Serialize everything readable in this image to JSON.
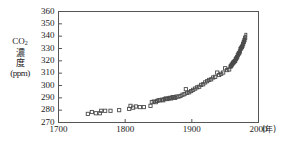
{
  "chart_data": {
    "type": "scatter",
    "title": "",
    "xlabel": "(年)",
    "ylabel": "CO2 濃度 (ppm)",
    "xlim": [
      1700,
      2000
    ],
    "ylim": [
      270,
      360
    ],
    "xticks": [
      1700,
      1800,
      1900,
      2000
    ],
    "yticks": [
      270,
      280,
      290,
      300,
      310,
      320,
      330,
      340,
      350,
      360
    ],
    "grid": false,
    "legend": null,
    "marker": "open-square",
    "series": [
      {
        "name": "CO2 concentration",
        "x": [
          1744,
          1750,
          1756,
          1762,
          1764,
          1770,
          1778,
          1791,
          1806,
          1808,
          1812,
          1816,
          1822,
          1828,
          1838,
          1840,
          1843,
          1846,
          1848,
          1850,
          1852,
          1855,
          1857,
          1859,
          1861,
          1863,
          1865,
          1867,
          1869,
          1871,
          1873,
          1875,
          1877,
          1880,
          1883,
          1886,
          1889,
          1891,
          1893,
          1896,
          1899,
          1902,
          1905,
          1908,
          1911,
          1914,
          1917,
          1920,
          1923,
          1926,
          1929,
          1932,
          1935,
          1938,
          1941,
          1944,
          1947,
          1950,
          1953,
          1956,
          1958,
          1959,
          1960,
          1961,
          1962,
          1963,
          1964,
          1965,
          1966,
          1967,
          1968,
          1969,
          1970,
          1971,
          1972,
          1973,
          1974,
          1975,
          1976,
          1977,
          1978,
          1979,
          1980
        ],
        "y": [
          277.0,
          278.5,
          277.5,
          277.5,
          279.5,
          279.5,
          279.5,
          280.0,
          281.0,
          283.5,
          282.0,
          283.0,
          282.5,
          282.5,
          283.5,
          286.5,
          287.0,
          286.5,
          287.5,
          288.0,
          288.0,
          288.5,
          288.0,
          289.0,
          289.5,
          289.0,
          289.5,
          290.0,
          289.5,
          290.5,
          290.5,
          290.0,
          291.0,
          291.0,
          291.5,
          292.5,
          293.0,
          297.0,
          294.0,
          294.5,
          295.5,
          296.5,
          297.5,
          298.5,
          299.0,
          300.5,
          301.0,
          302.5,
          303.5,
          304.5,
          305.0,
          306.5,
          307.0,
          310.5,
          308.5,
          309.5,
          310.5,
          314.0,
          312.5,
          313.0,
          315.3,
          316.0,
          316.9,
          317.6,
          318.5,
          318.9,
          319.6,
          320.0,
          321.4,
          322.2,
          323.0,
          324.6,
          325.7,
          326.3,
          327.5,
          329.7,
          330.2,
          331.2,
          332.2,
          333.8,
          335.4,
          336.8,
          338.7
        ]
      },
      {
        "name": "Mauna Loa record",
        "x": [
          1958,
          1959,
          1960,
          1961,
          1962,
          1963,
          1964,
          1965,
          1966,
          1967,
          1968,
          1969,
          1970,
          1971,
          1972,
          1973,
          1974,
          1975,
          1976,
          1977,
          1978,
          1979,
          1980,
          1981
        ],
        "y": [
          315.5,
          316.2,
          317.0,
          317.8,
          318.6,
          319.1,
          319.8,
          320.5,
          321.8,
          322.6,
          323.5,
          325.0,
          326.0,
          326.8,
          328.0,
          330.0,
          330.8,
          331.8,
          332.8,
          334.5,
          336.0,
          337.5,
          339.5,
          341.5
        ]
      }
    ],
    "units_note": "(年)"
  },
  "ylabel_lines": {
    "line1_main": "CO",
    "line1_sub": "2",
    "line2": "濃",
    "line3": "度",
    "line4": "ppm"
  },
  "colors": {
    "axis": "#555555",
    "marker_stroke": "#4a4a4a",
    "text": "#1a1a1a",
    "background": "#ffffff"
  }
}
